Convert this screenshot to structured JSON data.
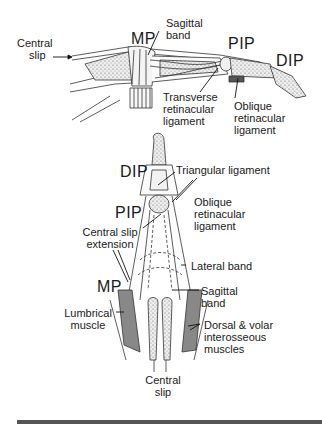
{
  "figure": {
    "lateral_view": {
      "labels": {
        "central_slip": "Central\nslip",
        "central_slip_line1": "Central",
        "central_slip_line2": "slip",
        "mp": "MP",
        "sagittal_band_line1": "Sagittal",
        "sagittal_band_line2": "band",
        "pip": "PIP",
        "dip": "DIP",
        "transverse_line1": "Transverse",
        "transverse_line2": "retinacular",
        "transverse_line3": "ligament",
        "oblique_line1": "Oblique",
        "oblique_line2": "retinacular",
        "oblique_line3": "ligament"
      }
    },
    "dorsal_view": {
      "labels": {
        "dip": "DIP",
        "triangular_ligament": "Triangular ligament",
        "oblique_line1": "Oblique",
        "oblique_line2": "retinacular",
        "oblique_line3": "ligament",
        "pip": "PIP",
        "central_slip_ext_line1": "Central slip",
        "central_slip_ext_line2": "extension",
        "lateral_band": "Lateral band",
        "mp": "MP",
        "sagittal_band_line1": "Sagittal",
        "sagittal_band_line2": "band",
        "lumbrical_line1": "Lumbrical",
        "lumbrical_line2": "muscle",
        "interosseous_line1": "Dorsal & volar",
        "interosseous_line2": "interosseous",
        "interosseous_line3": "muscles",
        "central_slip_line1": "Central",
        "central_slip_line2": "slip"
      }
    },
    "colors": {
      "ink": "#1a1a1a",
      "stipple_fill": "#d8d8d8",
      "bottom_bar": "#555555"
    }
  }
}
